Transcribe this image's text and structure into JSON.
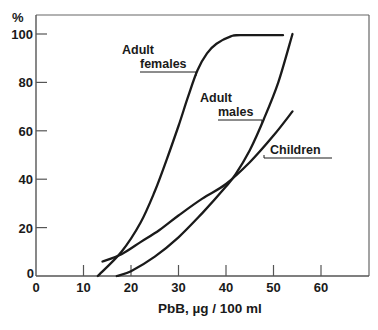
{
  "chart_data": {
    "type": "line",
    "title": "",
    "xlabel": "PbB,  µg / 100 ml",
    "ylabel": "%",
    "xlim": [
      0,
      70
    ],
    "ylim": [
      0,
      105
    ],
    "x_ticks": [
      0,
      10,
      20,
      30,
      40,
      50,
      60
    ],
    "y_ticks": [
      0,
      20,
      40,
      60,
      80,
      100
    ],
    "grid": false,
    "legend": "inline labels",
    "series": [
      {
        "name": "Adult females",
        "label_lines": [
          "Adult",
          "females"
        ],
        "x": [
          13,
          18,
          22,
          25,
          27.5,
          30,
          32,
          34,
          36,
          38,
          41,
          43,
          52
        ],
        "values": [
          0,
          10,
          22,
          35,
          48,
          62,
          74,
          85,
          92,
          96,
          99,
          99.5,
          99.5
        ]
      },
      {
        "name": "Adult males",
        "label_lines": [
          "Adult",
          "males"
        ],
        "x": [
          17,
          20,
          25,
          30,
          35,
          40,
          42,
          45,
          48,
          51,
          54
        ],
        "values": [
          0,
          2,
          8,
          16,
          26,
          37,
          42,
          52,
          65,
          80,
          100
        ]
      },
      {
        "name": "Children",
        "label_lines": [
          "Children"
        ],
        "x": [
          14,
          18,
          22,
          26,
          30,
          35,
          40,
          45,
          50,
          54
        ],
        "values": [
          6,
          9,
          14,
          19,
          25,
          32,
          38,
          47,
          58,
          68
        ]
      }
    ]
  },
  "labels": {
    "y_unit": "%",
    "x_axis_title": "PbB,  µg / 100 ml",
    "y_tick_labels": [
      "0",
      "20",
      "40",
      "60",
      "80",
      "100"
    ],
    "x_tick_labels": [
      "0",
      "10",
      "20",
      "30",
      "40",
      "50",
      "60"
    ],
    "females_line1": "Adult",
    "females_line2": "females",
    "males_line1": "Adult",
    "males_line2": "males",
    "children": "Children"
  },
  "colors": {
    "ink": "#1a1a1a",
    "frame": "#555555",
    "background": "#ffffff"
  }
}
